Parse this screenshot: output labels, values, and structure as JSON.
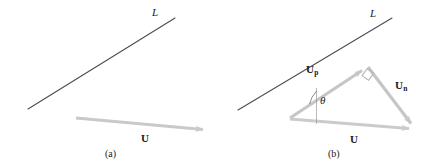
{
  "figure": {
    "width": 440,
    "height": 167,
    "background": "#ffffff",
    "colors": {
      "line": "#4a4a52",
      "vector": "#c9c9c9",
      "vector_dark": "#bdbdbd",
      "text": "#1a1a1a",
      "thin_rule": "#9a9a9a"
    }
  },
  "panels": [
    {
      "id": "a",
      "caption": "(a)",
      "line_label": "L",
      "labels": {
        "u": "U"
      },
      "geometry": {
        "line": {
          "x1": 28,
          "y1": 109,
          "x2": 175,
          "y2": 18
        },
        "vector_u": {
          "x1": 76,
          "y1": 118,
          "x2": 210,
          "y2": 130
        }
      }
    },
    {
      "id": "b",
      "caption": "(b)",
      "line_label": "L",
      "labels": {
        "u": "U",
        "u_parallel_base": "U",
        "u_parallel_sub": "p",
        "u_normal_base": "U",
        "u_normal_sub": "n",
        "theta": "θ"
      },
      "geometry": {
        "line": {
          "x1": 18,
          "y1": 110,
          "x2": 172,
          "y2": 18
        },
        "triangle": {
          "origin": {
            "x": 70,
            "y": 118
          },
          "apex": {
            "x": 148,
            "y": 67
          },
          "foot": {
            "x": 196,
            "y": 130
          }
        },
        "theta_arc_radius": 26,
        "right_angle_size": 10
      }
    }
  ]
}
